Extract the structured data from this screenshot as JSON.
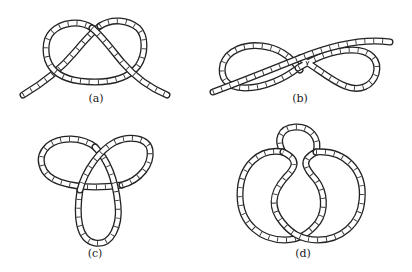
{
  "figure": {
    "panels": [
      {
        "id": "a",
        "label": "(a)",
        "description": "overhand knot (open rope)"
      },
      {
        "id": "b",
        "label": "(b)",
        "description": "figure-eight knot (open rope)"
      },
      {
        "id": "c",
        "label": "(c)",
        "description": "trefoil knot (closed loop)"
      },
      {
        "id": "d",
        "label": "(d)",
        "description": "figure-eight knot (closed loop)"
      }
    ]
  },
  "colors": {
    "stroke": "#222222",
    "background": "#ffffff"
  }
}
